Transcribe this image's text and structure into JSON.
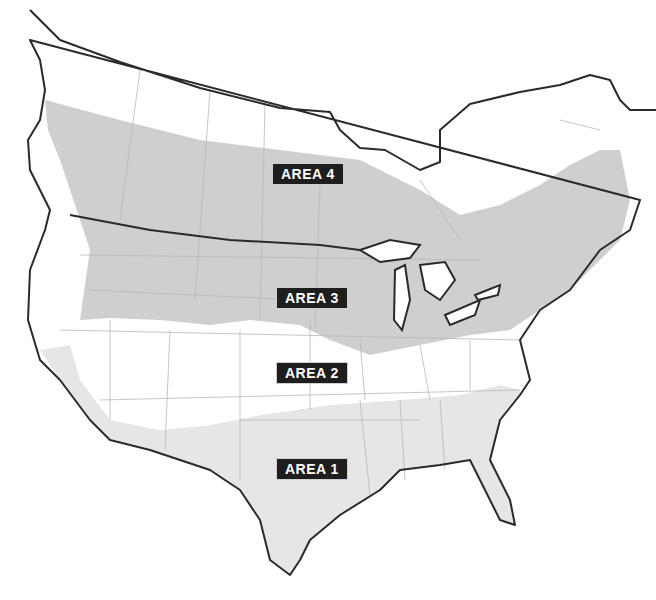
{
  "map": {
    "title": "",
    "areas": [
      {
        "id": "area-4",
        "label": "AREA 4",
        "x": 272,
        "y": 163,
        "fill": "#ffffff"
      },
      {
        "id": "area-3",
        "label": "AREA 3",
        "x": 276,
        "y": 287,
        "fill": "#cfcfcf"
      },
      {
        "id": "area-2",
        "label": "AREA 2",
        "x": 276,
        "y": 362,
        "fill": "#ffffff"
      },
      {
        "id": "area-1",
        "label": "AREA 1",
        "x": 276,
        "y": 458,
        "fill": "#e6e6e6"
      }
    ],
    "colors": {
      "coastline": "#2a2a2a",
      "state_border": "#b8b8b8",
      "area3_band": "#cfcfcf",
      "area1_fill": "#e6e6e6",
      "label_bg": "#1e1e1e",
      "label_text": "#ffffff"
    }
  }
}
